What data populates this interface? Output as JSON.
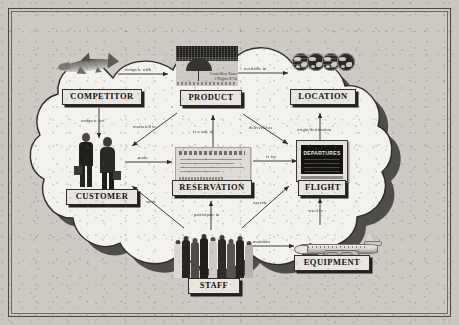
{
  "diagram": {
    "title_visible": false,
    "type": "entity-relationship concept map",
    "background_hex": "#c9c5bf",
    "cloud_fill_hex": "#f4f2ee",
    "cloud_shadow_hex": "#3a3835",
    "entities": [
      {
        "id": "competitor",
        "label": "COMPETITOR",
        "art": "shark-illustration"
      },
      {
        "id": "product",
        "label": "PRODUCT",
        "art": "brochure-photo"
      },
      {
        "id": "location",
        "label": "LOCATION",
        "art": "globes-row"
      },
      {
        "id": "customer",
        "label": "CUSTOMER",
        "art": "business-couple-photo"
      },
      {
        "id": "reservation",
        "label": "RESERVATION",
        "art": "airline-ticket-photo"
      },
      {
        "id": "flight",
        "label": "FLIGHT",
        "art": "departures-board-photo"
      },
      {
        "id": "staff",
        "label": "STAFF",
        "art": "staff-group-photo"
      },
      {
        "id": "equipment",
        "label": "EQUIPMENT",
        "art": "airplane-illustration"
      }
    ],
    "relationships": [
      {
        "id": "r1",
        "from": "competitor",
        "to": "product",
        "label": "compete with",
        "arrow": "single"
      },
      {
        "id": "r2",
        "from": "product",
        "to": "location",
        "label": "available in",
        "arrow": "single"
      },
      {
        "id": "r3",
        "from": "competitor",
        "to": "customer",
        "label": "compete for",
        "arrow": "single"
      },
      {
        "id": "r4",
        "from": "product",
        "to": "customer",
        "label": "marketed to",
        "arrow": "single"
      },
      {
        "id": "r5",
        "from": "reservation",
        "to": "product",
        "label": "is a sale of",
        "arrow": "single"
      },
      {
        "id": "r6",
        "from": "product",
        "to": "flight",
        "label": "delivered as",
        "arrow": "single"
      },
      {
        "id": "r7",
        "from": "flight",
        "to": "location",
        "label": "origin/destination",
        "arrow": "single"
      },
      {
        "id": "r8",
        "from": "customer",
        "to": "reservation",
        "label": "make",
        "arrow": "single"
      },
      {
        "id": "r9",
        "from": "reservation",
        "to": "flight",
        "label": "is for",
        "arrow": "single"
      },
      {
        "id": "r10",
        "from": "staff",
        "to": "customer",
        "label": "serve",
        "arrow": "single"
      },
      {
        "id": "r11",
        "from": "staff",
        "to": "reservation",
        "label": "participate in",
        "arrow": "single"
      },
      {
        "id": "r12",
        "from": "staff",
        "to": "flight",
        "label": "operate",
        "arrow": "single"
      },
      {
        "id": "r13",
        "from": "equipment",
        "to": "flight",
        "label": "used in",
        "arrow": "single"
      },
      {
        "id": "r14",
        "from": "staff",
        "to": "equipment",
        "label": "maintain",
        "arrow": "single"
      }
    ],
    "product_art_caption": "Costa Rica Tours\n3 Nights $750"
  }
}
